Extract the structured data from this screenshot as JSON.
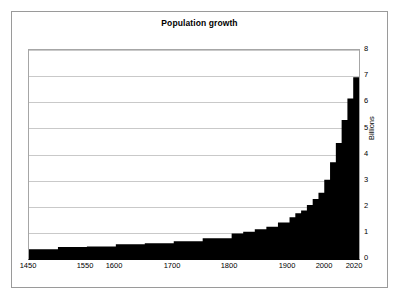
{
  "chart": {
    "title": "Population growth",
    "y_axis_title": "Billions",
    "y_ticks": [
      "8",
      "7",
      "6",
      "5",
      "4",
      "3",
      "2",
      "1",
      "0"
    ],
    "x_ticks": [
      "1450",
      "1550",
      "1600",
      "1700",
      "1800",
      "1900",
      "2000",
      "2020"
    ]
  },
  "chart_data": {
    "type": "area",
    "title": "Population growth",
    "xlabel": "",
    "ylabel": "Billions",
    "ylim": [
      0,
      8
    ],
    "xlim": [
      1450,
      2020
    ],
    "grid": true,
    "legend": null,
    "y_tick_values": [
      0,
      1,
      2,
      3,
      4,
      5,
      6,
      7,
      8
    ],
    "x_tick_values": [
      1450,
      1550,
      1600,
      1700,
      1800,
      1900,
      2000,
      2020
    ],
    "series": [
      {
        "name": "World population",
        "units": "billions",
        "x": [
          1450,
          1500,
          1550,
          1600,
          1650,
          1700,
          1750,
          1800,
          1820,
          1840,
          1860,
          1880,
          1900,
          1910,
          1920,
          1930,
          1940,
          1950,
          1960,
          1970,
          1980,
          1990,
          2000,
          2010,
          2020
        ],
        "values": [
          0.37,
          0.46,
          0.48,
          0.56,
          0.6,
          0.68,
          0.79,
          0.98,
          1.04,
          1.14,
          1.23,
          1.4,
          1.6,
          1.75,
          1.86,
          2.07,
          2.3,
          2.54,
          3.03,
          3.7,
          4.44,
          5.32,
          6.14,
          6.96,
          7.4
        ]
      }
    ]
  }
}
